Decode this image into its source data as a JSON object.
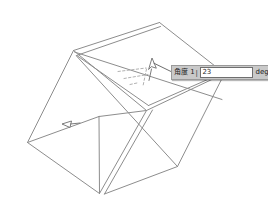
{
  "app": {
    "kind": "cad-3d-modeler",
    "background_color": "#ffffff",
    "line_color": "#8d8d8d",
    "dashed_line_color": "#a8a8a8"
  },
  "viewport": {
    "name": "3d-model-viewport",
    "model": "rectangular-box-wireframe",
    "width": 268,
    "height": 219
  },
  "dimension_input": {
    "label": "角度 1",
    "separator": "|",
    "value": "23",
    "unit": "degr",
    "spinner_icon": "spinner-updown-icon",
    "field_background": "#ffffff",
    "bar_background": "#c9c9c9",
    "button_background": "#b8b8b8"
  },
  "annotations": {
    "cursor_marker": "rotate-handle-cursor",
    "face_marker": "face-direction-arrow",
    "leader_line": "tooltip-leader-line",
    "angle_guides": "dashed-angle-guides"
  }
}
